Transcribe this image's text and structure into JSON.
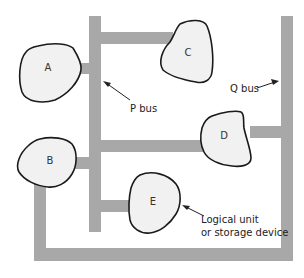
{
  "diagram": {
    "type": "bus-topology",
    "colors": {
      "bus": "#a8a8a8",
      "unit_fill": "#f1f1f1",
      "unit_stroke": "#1a1a1a",
      "text": "#222222"
    },
    "units": [
      {
        "id": "A",
        "label": "A"
      },
      {
        "id": "B",
        "label": "B"
      },
      {
        "id": "C",
        "label": "C"
      },
      {
        "id": "D",
        "label": "D"
      },
      {
        "id": "E",
        "label": "E"
      }
    ],
    "buses": [
      {
        "id": "P",
        "label": "P bus",
        "connects": [
          "A",
          "B",
          "C",
          "D",
          "E"
        ]
      },
      {
        "id": "Q",
        "label": "Q bus",
        "connects": [
          "B",
          "D"
        ]
      }
    ],
    "annotations": {
      "p_bus": "P bus",
      "q_bus": "Q bus",
      "unit_line1": "Logical unit",
      "unit_line2": "or storage device"
    }
  }
}
